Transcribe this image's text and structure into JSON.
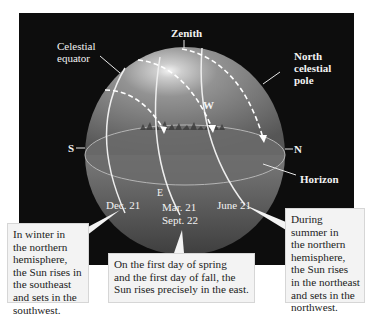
{
  "diagram": {
    "colors": {
      "background": "#0d0d0d",
      "sphere": "#8a8a8a",
      "horizon_disk": "#6e6e6e",
      "paths": "#f0f0f0",
      "callout_bg": "#f3f3f3"
    },
    "labels": {
      "zenith": "Zenith",
      "celestial_equator_1": "Celestial",
      "celestial_equator_2": "equator",
      "north_pole_1": "North",
      "north_pole_2": "celestial",
      "north_pole_3": "pole",
      "west": "W",
      "south": "S",
      "north": "N",
      "east": "E",
      "horizon": "Horizon",
      "dec21": "Dec. 21",
      "mar21": "Mar. 21",
      "sept22": "Sept. 22",
      "june21": "June 21"
    },
    "callouts": {
      "winter": [
        "In winter in",
        "the northern",
        "hemisphere,",
        "the Sun rises in",
        "the southeast",
        "and sets in the",
        "southwest."
      ],
      "equinox": [
        "On the first day of spring",
        "and the first day of fall, the",
        "Sun rises precisely in the east."
      ],
      "summer": [
        "During",
        "summer in",
        "the northern",
        "hemisphere,",
        "the Sun rises",
        "in the northeast",
        "and sets in the",
        "northwest."
      ]
    }
  }
}
